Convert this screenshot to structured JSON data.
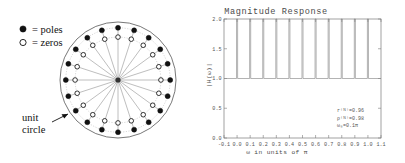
{
  "polezero": {
    "legend": [
      {
        "marker": "filled-circle",
        "text": "=  poles"
      },
      {
        "marker": "open-circle",
        "text": "=  zeros"
      }
    ],
    "annotation_line1": "unit",
    "annotation_line2": "circle",
    "unit_circle_radius": 1.0,
    "pole_count": 20,
    "zero_count": 20,
    "pole_radius": 0.9,
    "zero_radius": 0.74,
    "spoke_count": 20
  },
  "chart_data": {
    "type": "line",
    "title": "Magnitude Response",
    "xlabel": "ω in units of π",
    "ylabel": "|H(ω)|",
    "xlim": [
      -0.1,
      1.1
    ],
    "ylim": [
      0.0,
      2.0
    ],
    "grid": false,
    "legend": "none",
    "xticks": [
      -0.1,
      0.0,
      0.1,
      0.2,
      0.3,
      0.4,
      0.5,
      0.6,
      0.7,
      0.8,
      0.9,
      1.0,
      1.1
    ],
    "xtick_labels": [
      "-0.1",
      "0.0",
      "0.1",
      "0.2",
      "0.3",
      "0.4",
      "0.5",
      "0.6",
      "0.7",
      "0.8",
      "0.9",
      "1.0",
      "1.1"
    ],
    "yticks": [
      0.0,
      0.5,
      1.0,
      1.5,
      2.0
    ],
    "ytick_labels": [
      "0.0",
      "0.5",
      "1.0",
      "1.5",
      "2.0"
    ],
    "baseline_value": 1.0,
    "peak_value": 2.0,
    "spike_positions": [
      0.0,
      0.1,
      0.2,
      0.3,
      0.4,
      0.5,
      0.6,
      0.7,
      0.8,
      0.9,
      1.0
    ],
    "spike_half_width": 0.004,
    "series": [
      {
        "name": "|H(ω)|",
        "description": "comb response: flat at 1.0 with narrow resonant spikes clipped at 2.0 at each multiple of 0.1π",
        "x": [
          -0.1,
          0.0,
          0.1,
          0.2,
          0.3,
          0.4,
          0.5,
          0.6,
          0.7,
          0.8,
          0.9,
          1.0,
          1.1
        ],
        "values": [
          1.0,
          2.0,
          2.0,
          2.0,
          2.0,
          2.0,
          2.0,
          2.0,
          2.0,
          2.0,
          2.0,
          2.0,
          1.0
        ]
      }
    ],
    "annotations": [
      {
        "text": "r⁽ᴺ⁾=0.96"
      },
      {
        "text": "ρ⁽ᴺ⁾=0.98"
      },
      {
        "text": "ω₀=0.1π"
      }
    ]
  }
}
